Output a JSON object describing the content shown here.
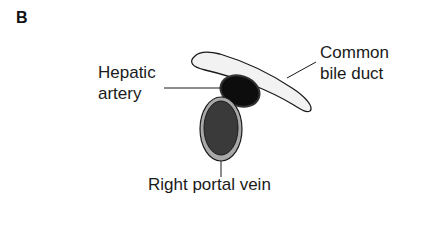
{
  "panel_label": "B",
  "labels": {
    "hepatic_artery": [
      "Hepatic",
      "artery"
    ],
    "common_bile_duct": [
      "Common",
      "bile duct"
    ],
    "right_portal_vein": "Right portal vein"
  },
  "colors": {
    "bile_duct_fill": "#f2f2f2",
    "hepatic_artery_fill": "#0d0d0d",
    "portal_vein_fill": "#3a3a3a",
    "portal_vein_rim": "#a8a8a8",
    "outline": "#1a1a1a"
  }
}
